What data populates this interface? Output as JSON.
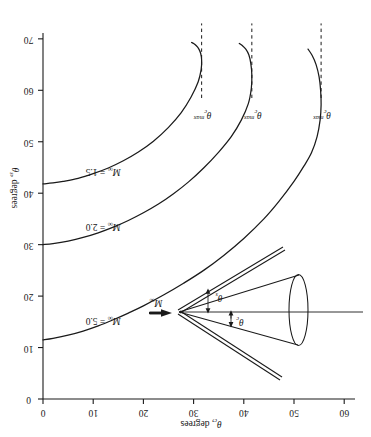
{
  "figure": {
    "orientation_note": "rotated-180",
    "background_color": "#ffffff",
    "ink_color": "#1a1a1a"
  },
  "axes": {
    "x": {
      "title_symbol": "θ",
      "title_sub": "c",
      "title_rest": ", degrees",
      "title_full": "θc, degrees",
      "min": 0,
      "max": 60,
      "ticks": [
        0,
        10,
        20,
        30,
        40,
        50,
        60
      ],
      "tick_labels": [
        "0",
        "10",
        "20",
        "30",
        "40",
        "50",
        "60"
      ]
    },
    "y": {
      "title_symbol": "θ",
      "title_sub": "s",
      "title_rest": ", degrees",
      "title_full": "θs, degrees",
      "min": 0,
      "max": 70,
      "ticks": [
        0,
        10,
        20,
        30,
        40,
        50,
        60,
        70
      ],
      "tick_labels": [
        "0",
        "10",
        "20",
        "30",
        "40",
        "50",
        "60",
        "70"
      ]
    }
  },
  "chart_data": {
    "type": "line",
    "title": "",
    "subtitle": "",
    "xlabel": "θc, degrees",
    "ylabel": "θs, degrees",
    "xlim": [
      0,
      60
    ],
    "ylim": [
      0,
      70
    ],
    "grid": false,
    "legend_position": "inline-on-curve",
    "annotations": [
      {
        "text": "θc max",
        "curve": "M∞ = 5.0",
        "x": 55.4,
        "kind": "dashed-vertical"
      },
      {
        "text": "θc max",
        "curve": "M∞ = 2.0",
        "x": 41.6,
        "kind": "dashed-vertical"
      },
      {
        "text": "θc max",
        "curve": "M∞ = 1.5",
        "x": 31.6,
        "kind": "dashed-vertical"
      }
    ],
    "series": [
      {
        "name": "M∞ = 5.0",
        "label": "M∞ = 5.0",
        "mach": 5.0,
        "theta_c_max": 55.4,
        "label_at": {
          "x": 12.0,
          "y": 15.3
        },
        "x": [
          0.0,
          2.0,
          5.0,
          8.0,
          11.0,
          14.0,
          17.0,
          20.0,
          24.0,
          28.0,
          32.0,
          36.0,
          40.0,
          44.0,
          47.0,
          50.0,
          52.0,
          53.5,
          54.6,
          55.2,
          55.4,
          55.3,
          55.0,
          54.4,
          53.6,
          52.8
        ],
        "y": [
          11.5,
          11.8,
          12.4,
          13.2,
          14.2,
          15.4,
          16.7,
          18.1,
          20.2,
          22.5,
          25.0,
          27.9,
          31.2,
          35.0,
          38.4,
          42.3,
          45.3,
          47.9,
          51.0,
          54.2,
          57.2,
          60.0,
          62.6,
          65.0,
          66.8,
          68.0
        ]
      },
      {
        "name": "M∞ = 2.0",
        "label": "M∞ = 2.0",
        "mach": 2.0,
        "theta_c_max": 41.6,
        "label_at": {
          "x": 12.0,
          "y": 33.6
        },
        "x": [
          0.0,
          2.0,
          5.0,
          8.0,
          11.0,
          14.0,
          17.0,
          20.0,
          23.0,
          26.0,
          29.0,
          32.0,
          35.0,
          37.5,
          39.5,
          40.9,
          41.5,
          41.6,
          41.4,
          41.0,
          40.4,
          39.7,
          39.1
        ],
        "y": [
          30.0,
          30.2,
          30.7,
          31.4,
          32.3,
          33.4,
          34.7,
          36.2,
          37.9,
          39.9,
          42.2,
          44.9,
          48.0,
          51.0,
          54.2,
          57.4,
          60.4,
          63.0,
          65.2,
          66.9,
          68.0,
          68.7,
          69.1
        ]
      },
      {
        "name": "M∞ = 1.5",
        "label": "M∞ = 1.5",
        "mach": 1.5,
        "theta_c_max": 31.6,
        "label_at": {
          "x": 12.0,
          "y": 44.4
        },
        "x": [
          0.0,
          2.0,
          4.0,
          7.0,
          10.0,
          13.0,
          16.0,
          19.0,
          22.0,
          25.0,
          27.5,
          29.5,
          30.9,
          31.5,
          31.6,
          31.4,
          31.0,
          30.5,
          30.0,
          29.6
        ],
        "y": [
          41.8,
          42.0,
          42.3,
          42.9,
          43.8,
          44.9,
          46.3,
          48.0,
          50.1,
          52.8,
          55.6,
          58.7,
          61.6,
          64.0,
          65.9,
          67.2,
          68.1,
          68.7,
          69.1,
          69.3
        ]
      }
    ]
  },
  "diagram": {
    "name": "cone-shock-schematic",
    "freestream_label": "M∞",
    "freestream_symbol": "M",
    "freestream_sub": "∞",
    "cone_angle_label": "θc",
    "cone_angle_symbol": "θ",
    "cone_angle_sub": "c",
    "shock_angle_label": "θs",
    "shock_angle_symbol": "θ",
    "shock_angle_sub": "s"
  },
  "theta_max_text": {
    "symbol": "θ",
    "sub": "c",
    "sup_word": "max",
    "full": "θc max"
  }
}
